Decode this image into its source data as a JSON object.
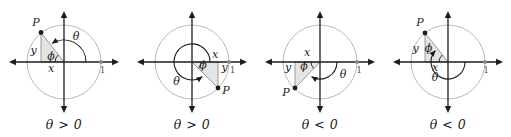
{
  "figure": {
    "panels": [
      {
        "caption": "θ > 0",
        "labels": {
          "P": "P",
          "x": "x",
          "y": "y",
          "phi": "ϕ",
          "theta": "θ",
          "one": "1"
        }
      },
      {
        "caption": "θ > 0",
        "labels": {
          "P": "P",
          "x": "x",
          "y": "y",
          "phi": "ϕ",
          "theta": "θ",
          "one": "1"
        }
      },
      {
        "caption": "θ < 0",
        "labels": {
          "P": "P",
          "x": "x",
          "y": "y",
          "phi": "ϕ",
          "theta": "θ",
          "one": "1"
        }
      },
      {
        "caption": "θ < 0",
        "labels": {
          "P": "P",
          "x": "x",
          "y": "y",
          "phi": "ϕ",
          "theta": "θ",
          "one": "1"
        }
      }
    ]
  },
  "colors": {
    "axis": "#1c1c1c",
    "circle": "#b9b9b9",
    "triangle-fill": "#e4e4e4",
    "triangle-stroke": "#9a9a9a",
    "unit-dot": "#8a8a8a",
    "label": "#222222",
    "unit-label": "#555555"
  }
}
